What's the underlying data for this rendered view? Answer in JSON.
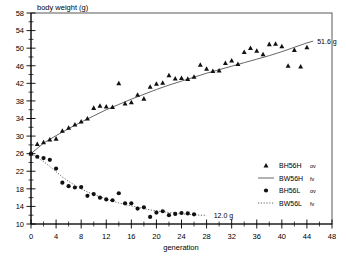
{
  "chart_data": {
    "type": "scatter",
    "title": "",
    "ylabel": "body weight (g)",
    "xlabel": "generation",
    "xlim": [
      0,
      48
    ],
    "ylim": [
      10,
      58
    ],
    "x_ticks": [
      0,
      4,
      8,
      12,
      16,
      20,
      24,
      28,
      32,
      36,
      40,
      44,
      48
    ],
    "x_tick_labels": [
      "0",
      "4",
      "8",
      "12",
      "16",
      "20",
      "24",
      "28",
      "32",
      "36",
      "40",
      "44",
      "48"
    ],
    "x_minor_step": 2,
    "y_ticks": [
      10,
      14,
      18,
      22,
      26,
      30,
      34,
      38,
      42,
      46,
      50,
      54,
      58
    ],
    "y_tick_labels": [
      "10",
      "14",
      "18",
      "22",
      "26",
      "30",
      "34",
      "38",
      "42",
      "46",
      "50",
      "54",
      "58"
    ],
    "y_minor_step": 2,
    "grid": false,
    "legend_position": "right-middle",
    "annotations": [
      {
        "text": "51.6 g",
        "x": 45.0,
        "y": 51.6,
        "name": "high-line-endpoint-label"
      },
      {
        "text": "12.0 g",
        "x": 28.5,
        "y": 12.0,
        "name": "low-line-endpoint-label"
      }
    ],
    "series": [
      {
        "name": "BH56H ov",
        "kind": "scatter",
        "marker": "triangle",
        "color": "#111111",
        "points": [
          [
            0,
            26.0
          ],
          [
            1,
            28.2
          ],
          [
            2,
            28.6
          ],
          [
            3,
            29.2
          ],
          [
            4,
            29.4
          ],
          [
            5,
            31.2
          ],
          [
            6,
            31.9
          ],
          [
            7,
            32.6
          ],
          [
            8,
            33.3
          ],
          [
            9,
            34.0
          ],
          [
            10,
            36.4
          ],
          [
            11,
            36.9
          ],
          [
            12,
            36.7
          ],
          [
            13,
            36.6
          ],
          [
            14,
            42.0
          ],
          [
            15,
            37.4
          ],
          [
            16,
            37.7
          ],
          [
            17,
            39.4
          ],
          [
            18,
            38.5
          ],
          [
            19,
            41.2
          ],
          [
            20,
            41.9
          ],
          [
            21,
            42.1
          ],
          [
            22,
            43.8
          ],
          [
            23,
            43.1
          ],
          [
            24,
            43.2
          ],
          [
            25,
            43.0
          ],
          [
            26,
            43.5
          ],
          [
            27,
            46.2
          ],
          [
            28,
            45.3
          ],
          [
            29,
            44.8
          ],
          [
            30,
            44.9
          ],
          [
            31,
            46.6
          ],
          [
            32,
            47.2
          ],
          [
            33,
            46.4
          ],
          [
            34,
            49.1
          ],
          [
            35,
            50.0
          ],
          [
            36,
            49.4
          ],
          [
            37,
            48.6
          ],
          [
            38,
            50.9
          ],
          [
            39,
            51.0
          ],
          [
            40,
            50.4
          ],
          [
            41,
            46.0
          ],
          [
            42,
            49.6
          ],
          [
            43,
            45.8
          ],
          [
            44,
            50.2
          ]
        ]
      },
      {
        "name": "BW56H fv",
        "kind": "line",
        "style": "solid",
        "color": "#555555",
        "points": [
          [
            0,
            26.0
          ],
          [
            2,
            28.4
          ],
          [
            4,
            30.1
          ],
          [
            6,
            31.7
          ],
          [
            8,
            33.2
          ],
          [
            10,
            34.6
          ],
          [
            12,
            36.0
          ],
          [
            14,
            37.2
          ],
          [
            16,
            38.4
          ],
          [
            18,
            39.5
          ],
          [
            20,
            40.6
          ],
          [
            22,
            41.6
          ],
          [
            24,
            42.5
          ],
          [
            26,
            43.4
          ],
          [
            28,
            44.3
          ],
          [
            30,
            45.1
          ],
          [
            32,
            45.9
          ],
          [
            34,
            46.7
          ],
          [
            36,
            47.5
          ],
          [
            38,
            48.3
          ],
          [
            40,
            49.2
          ],
          [
            42,
            50.2
          ],
          [
            44,
            51.2
          ],
          [
            45,
            51.6
          ]
        ]
      },
      {
        "name": "BH56L ov",
        "kind": "scatter",
        "marker": "circle",
        "color": "#111111",
        "points": [
          [
            0,
            26.0
          ],
          [
            1,
            25.3
          ],
          [
            2,
            25.0
          ],
          [
            3,
            24.6
          ],
          [
            4,
            22.6
          ],
          [
            5,
            19.4
          ],
          [
            6,
            18.6
          ],
          [
            7,
            18.3
          ],
          [
            8,
            18.4
          ],
          [
            9,
            16.4
          ],
          [
            10,
            16.8
          ],
          [
            11,
            16.0
          ],
          [
            12,
            15.6
          ],
          [
            13,
            15.4
          ],
          [
            14,
            17.0
          ],
          [
            15,
            14.7
          ],
          [
            16,
            14.7
          ],
          [
            17,
            13.5
          ],
          [
            18,
            13.8
          ],
          [
            19,
            11.6
          ],
          [
            20,
            12.6
          ],
          [
            21,
            12.9
          ],
          [
            22,
            12.0
          ],
          [
            23,
            12.3
          ],
          [
            24,
            12.5
          ],
          [
            25,
            12.4
          ],
          [
            26,
            12.2
          ]
        ]
      },
      {
        "name": "BW56L fv",
        "kind": "line",
        "style": "dotted",
        "color": "#555555",
        "points": [
          [
            0,
            26.0
          ],
          [
            1,
            25.2
          ],
          [
            2,
            24.2
          ],
          [
            3,
            23.1
          ],
          [
            4,
            21.9
          ],
          [
            5,
            20.7
          ],
          [
            6,
            19.7
          ],
          [
            7,
            18.8
          ],
          [
            8,
            18.0
          ],
          [
            9,
            17.3
          ],
          [
            10,
            16.7
          ],
          [
            11,
            16.2
          ],
          [
            12,
            15.7
          ],
          [
            13,
            15.2
          ],
          [
            14,
            14.8
          ],
          [
            15,
            14.4
          ],
          [
            16,
            14.1
          ],
          [
            17,
            13.8
          ],
          [
            18,
            13.5
          ],
          [
            19,
            13.2
          ],
          [
            20,
            13.0
          ],
          [
            21,
            12.8
          ],
          [
            22,
            12.6
          ],
          [
            23,
            12.5
          ],
          [
            24,
            12.3
          ],
          [
            25,
            12.2
          ],
          [
            26,
            12.1
          ],
          [
            27,
            12.0
          ],
          [
            28,
            12.0
          ]
        ]
      }
    ],
    "legend": [
      {
        "label": "BH56H",
        "suffix": "ov",
        "marker": "triangle"
      },
      {
        "label": "BW56H",
        "suffix": "fv",
        "marker": "solid-line"
      },
      {
        "label": "BH56L",
        "suffix": "ov",
        "marker": "circle"
      },
      {
        "label": "BW56L",
        "suffix": "fv",
        "marker": "dotted-line"
      }
    ]
  }
}
